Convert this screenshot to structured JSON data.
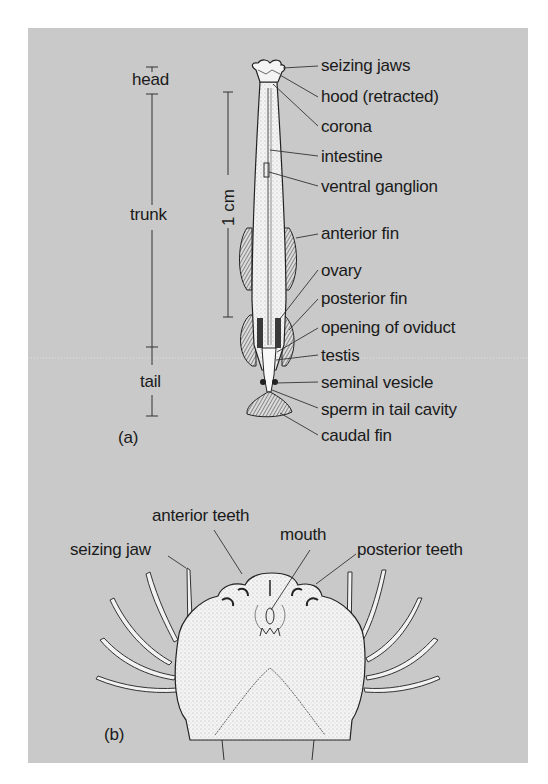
{
  "figure": {
    "background_color": "#c9c9c9",
    "panel_a": {
      "tag": "(a)",
      "regions": {
        "head": "head",
        "trunk": "trunk",
        "tail": "tail"
      },
      "scale_bar": "1 cm",
      "labels": [
        "seizing jaws",
        "hood (retracted)",
        "corona",
        "intestine",
        "ventral ganglion",
        "anterior fin",
        "ovary",
        "posterior fin",
        "opening of oviduct",
        "testis",
        "seminal vesicle",
        "sperm in tail cavity",
        "caudal fin"
      ]
    },
    "panel_b": {
      "tag": "(b)",
      "labels": {
        "anterior_teeth": "anterior teeth",
        "mouth": "mouth",
        "seizing_jaw": "seizing jaw",
        "posterior_teeth": "posterior teeth"
      }
    }
  }
}
